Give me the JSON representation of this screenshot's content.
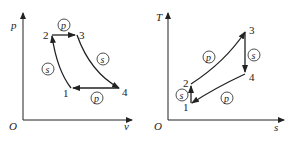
{
  "diagrams": [
    {
      "id": "pv",
      "axes": {
        "y_label": "p",
        "x_label": "v",
        "origin_label": "O"
      },
      "points": [
        {
          "label": "1"
        },
        {
          "label": "2"
        },
        {
          "label": "3"
        },
        {
          "label": "4"
        }
      ],
      "process_labels": [
        {
          "from": "1",
          "to": "2",
          "label": "s"
        },
        {
          "from": "2",
          "to": "3",
          "label": "p"
        },
        {
          "from": "3",
          "to": "4",
          "label": "s"
        },
        {
          "from": "4",
          "to": "1",
          "label": "p"
        }
      ]
    },
    {
      "id": "ts",
      "axes": {
        "y_label": "T",
        "x_label": "s",
        "origin_label": "O"
      },
      "points": [
        {
          "label": "1"
        },
        {
          "label": "2"
        },
        {
          "label": "3"
        },
        {
          "label": "4"
        }
      ],
      "process_labels": [
        {
          "from": "1",
          "to": "2",
          "label": "s"
        },
        {
          "from": "2",
          "to": "3",
          "label": "p"
        },
        {
          "from": "3",
          "to": "4",
          "label": "s"
        },
        {
          "from": "4",
          "to": "1",
          "label": "p"
        }
      ]
    }
  ],
  "colors": {
    "line": "#222222",
    "background": "#ffffff"
  }
}
